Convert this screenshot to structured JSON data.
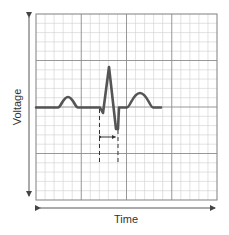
{
  "diagram": {
    "type": "ecg-trace",
    "axes": {
      "x_label": "Time",
      "y_label": "Voltage"
    },
    "grid": {
      "major_columns": 4,
      "major_rows": 4,
      "minor_per_major": 5
    },
    "waveform": {
      "components": [
        "P wave",
        "QRS complex",
        "T wave"
      ],
      "annotation": "QRS duration interval marked by dashed lines and double-headed arrow"
    },
    "colors": {
      "trace": "#555555",
      "major_grid": "#888888",
      "minor_grid": "#c8c8c8",
      "border": "#8a8a8a",
      "axis_arrow": "#444444",
      "text": "#333333"
    }
  }
}
